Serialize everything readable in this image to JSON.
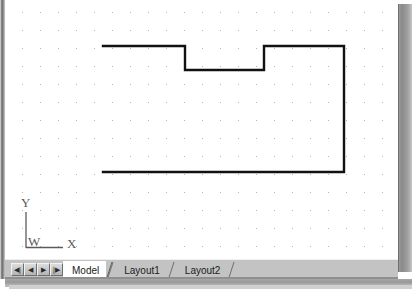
{
  "application": {
    "name": "cad-model-space",
    "canvas_background": "#ffffff",
    "grid": {
      "visible": true,
      "dot_color": "#b5b5b5",
      "spacing_px": 18,
      "origin_x_px": 17,
      "origin_y_px": 12
    }
  },
  "drawing": {
    "entity_name": "open-polyline-profile",
    "line_color": "#111111",
    "line_width_px": 2.4,
    "description": "C-shaped open profile with rectangular notch in the top edge",
    "vertices": [
      {
        "label": "top-left-start",
        "x": 98,
        "y": 46
      },
      {
        "label": "notch-top-left",
        "x": 180,
        "y": 46
      },
      {
        "label": "notch-bottom-left",
        "x": 180,
        "y": 70
      },
      {
        "label": "notch-bottom-right",
        "x": 259,
        "y": 70
      },
      {
        "label": "notch-top-right",
        "x": 259,
        "y": 46
      },
      {
        "label": "top-right-corner",
        "x": 339,
        "y": 46
      },
      {
        "label": "bottom-right-corner",
        "x": 339,
        "y": 172
      },
      {
        "label": "bottom-left-end",
        "x": 98,
        "y": 172
      }
    ]
  },
  "ucs_icon": {
    "name": "world-coordinate-system-icon",
    "y_axis_label": "Y",
    "x_axis_label": "X",
    "world_marker_label": "W",
    "stroke_color": "#5b5b5b"
  },
  "tab_bar": {
    "nav_buttons": [
      {
        "name": "first-tab-button",
        "glyph": "◀|",
        "tooltip": "First"
      },
      {
        "name": "previous-tab-button",
        "glyph": "◀",
        "tooltip": "Previous"
      },
      {
        "name": "next-tab-button",
        "glyph": "▶",
        "tooltip": "Next"
      },
      {
        "name": "last-tab-button",
        "glyph": "|▶",
        "tooltip": "Last"
      }
    ],
    "tabs": [
      {
        "label": "Model",
        "active": true
      },
      {
        "label": "Layout1",
        "active": false
      },
      {
        "label": "Layout2",
        "active": false
      }
    ]
  }
}
